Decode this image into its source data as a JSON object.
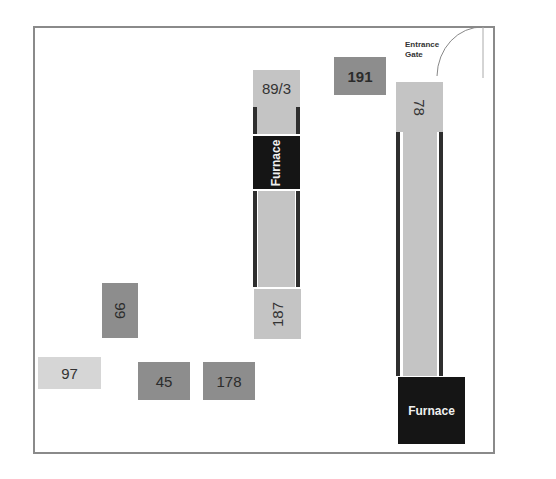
{
  "diagram": {
    "type": "floor-plan",
    "entrance": {
      "line1": "Entrance",
      "line2": "Gate"
    },
    "machines": [
      {
        "id": "m-191",
        "label": "191"
      },
      {
        "id": "m-89-3",
        "label": "89/3"
      },
      {
        "id": "m-furnace-1",
        "label": "Furnace"
      },
      {
        "id": "m-187",
        "label": "187"
      },
      {
        "id": "m-78",
        "label": "78"
      },
      {
        "id": "m-furnace-2",
        "label": "Furnace"
      },
      {
        "id": "m-99",
        "label": "99"
      },
      {
        "id": "m-97",
        "label": "97"
      },
      {
        "id": "m-45",
        "label": "45"
      },
      {
        "id": "m-178",
        "label": "178"
      }
    ],
    "colors": {
      "wall": "#8a8a8a",
      "light_machine": "#c4c4c4",
      "medium_machine": "#8d8d8d",
      "furnace": "#151515",
      "rail": "#2e2e2e"
    }
  }
}
